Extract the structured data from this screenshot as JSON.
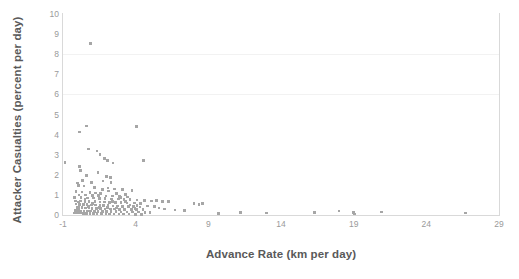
{
  "chart_data": {
    "type": "scatter",
    "title": "",
    "xlabel": "Advance Rate (km per day)",
    "ylabel": "Attacker Casualties (percent per day)",
    "xlim": [
      -1,
      29
    ],
    "ylim": [
      0,
      10
    ],
    "xticks": [
      "-1",
      "4",
      "9",
      "14",
      "19",
      "24",
      "29"
    ],
    "xtick_values": [
      -1,
      4,
      9,
      14,
      19,
      24,
      29
    ],
    "yticks": [
      "0",
      "1",
      "2",
      "3",
      "4",
      "5",
      "6",
      "7",
      "8",
      "9",
      "10"
    ],
    "ytick_values": [
      0,
      1,
      2,
      3,
      4,
      5,
      6,
      7,
      8,
      9,
      10
    ],
    "grid": "horizontal-faint",
    "gridline_values": [
      6,
      8
    ],
    "legend": "none",
    "marker_color": "#a6a6a6",
    "axis_color": "#d9d9d9",
    "tick_label_color": "#9a9a9a",
    "axis_title_color": "#595959",
    "points": [
      [
        0.9,
        8.52
      ],
      [
        0.6,
        4.42
      ],
      [
        4.05,
        4.4
      ],
      [
        0.15,
        4.12
      ],
      [
        0.75,
        3.28
      ],
      [
        1.35,
        3.18
      ],
      [
        1.55,
        3.02
      ],
      [
        1.85,
        2.82
      ],
      [
        2.05,
        2.7
      ],
      [
        2.45,
        2.58
      ],
      [
        4.55,
        2.72
      ],
      [
        -0.85,
        2.6
      ],
      [
        0.15,
        2.42
      ],
      [
        0.2,
        2.2
      ],
      [
        0.6,
        1.96
      ],
      [
        2.0,
        1.92
      ],
      [
        2.25,
        1.86
      ],
      [
        1.75,
        1.7
      ],
      [
        2.3,
        1.62
      ],
      [
        0.0,
        1.6
      ],
      [
        0.05,
        1.48
      ],
      [
        0.45,
        1.44
      ],
      [
        1.15,
        1.36
      ],
      [
        2.1,
        1.34
      ],
      [
        2.55,
        1.3
      ],
      [
        3.1,
        1.28
      ],
      [
        3.75,
        1.22
      ],
      [
        -0.1,
        1.16
      ],
      [
        0.3,
        1.14
      ],
      [
        0.85,
        1.12
      ],
      [
        1.25,
        1.1
      ],
      [
        1.6,
        1.08
      ],
      [
        2.7,
        1.06
      ],
      [
        3.3,
        1.02
      ],
      [
        0.1,
        1.0
      ],
      [
        0.55,
        0.99
      ],
      [
        1.05,
        0.97
      ],
      [
        1.45,
        0.96
      ],
      [
        1.95,
        0.95
      ],
      [
        2.4,
        0.94
      ],
      [
        2.9,
        0.92
      ],
      [
        3.45,
        0.9
      ],
      [
        -0.2,
        0.88
      ],
      [
        0.25,
        0.86
      ],
      [
        0.7,
        0.85
      ],
      [
        1.1,
        0.84
      ],
      [
        1.5,
        0.83
      ],
      [
        1.9,
        0.82
      ],
      [
        2.35,
        0.8
      ],
      [
        2.8,
        0.79
      ],
      [
        3.2,
        0.78
      ],
      [
        3.6,
        0.76
      ],
      [
        4.1,
        0.74
      ],
      [
        4.6,
        0.72
      ],
      [
        -0.15,
        0.7
      ],
      [
        0.2,
        0.69
      ],
      [
        0.5,
        0.68
      ],
      [
        0.8,
        0.67
      ],
      [
        1.2,
        0.66
      ],
      [
        1.55,
        0.65
      ],
      [
        1.85,
        0.64
      ],
      [
        2.2,
        0.63
      ],
      [
        2.6,
        0.62
      ],
      [
        3.0,
        0.61
      ],
      [
        3.4,
        0.6
      ],
      [
        3.9,
        0.59
      ],
      [
        4.35,
        0.58
      ],
      [
        5.1,
        0.7
      ],
      [
        5.45,
        0.72
      ],
      [
        5.85,
        0.68
      ],
      [
        6.25,
        0.66
      ],
      [
        8.0,
        0.58
      ],
      [
        8.35,
        0.52
      ],
      [
        8.6,
        0.56
      ],
      [
        -0.1,
        0.54
      ],
      [
        0.15,
        0.53
      ],
      [
        0.4,
        0.52
      ],
      [
        0.65,
        0.51
      ],
      [
        0.95,
        0.5
      ],
      [
        1.25,
        0.49
      ],
      [
        1.55,
        0.48
      ],
      [
        1.8,
        0.47
      ],
      [
        2.1,
        0.46
      ],
      [
        2.45,
        0.45
      ],
      [
        2.75,
        0.44
      ],
      [
        3.1,
        0.43
      ],
      [
        3.5,
        0.42
      ],
      [
        3.85,
        0.41
      ],
      [
        4.3,
        0.4
      ],
      [
        4.8,
        0.44
      ],
      [
        5.3,
        0.42
      ],
      [
        -0.05,
        0.38
      ],
      [
        0.1,
        0.37
      ],
      [
        0.3,
        0.36
      ],
      [
        0.55,
        0.35
      ],
      [
        0.8,
        0.34
      ],
      [
        1.0,
        0.33
      ],
      [
        1.3,
        0.32
      ],
      [
        1.6,
        0.31
      ],
      [
        1.9,
        0.3
      ],
      [
        2.25,
        0.3
      ],
      [
        2.55,
        0.29
      ],
      [
        2.9,
        0.28
      ],
      [
        3.25,
        0.28
      ],
      [
        3.7,
        0.27
      ],
      [
        4.05,
        0.26
      ],
      [
        4.5,
        0.26
      ],
      [
        6.7,
        0.24
      ],
      [
        7.35,
        0.22
      ],
      [
        -0.15,
        0.22
      ],
      [
        0.05,
        0.21
      ],
      [
        0.25,
        0.2
      ],
      [
        0.45,
        0.2
      ],
      [
        0.7,
        0.19
      ],
      [
        0.9,
        0.19
      ],
      [
        1.15,
        0.18
      ],
      [
        1.4,
        0.18
      ],
      [
        1.7,
        0.17
      ],
      [
        2.0,
        0.17
      ],
      [
        2.3,
        0.16
      ],
      [
        2.65,
        0.16
      ],
      [
        3.0,
        0.15
      ],
      [
        3.4,
        0.15
      ],
      [
        3.8,
        0.14
      ],
      [
        4.2,
        0.14
      ],
      [
        4.65,
        0.13
      ],
      [
        5.0,
        0.13
      ],
      [
        -0.2,
        0.1
      ],
      [
        0.0,
        0.09
      ],
      [
        0.2,
        0.09
      ],
      [
        0.4,
        0.08
      ],
      [
        0.6,
        0.08
      ],
      [
        0.85,
        0.07
      ],
      [
        1.1,
        0.07
      ],
      [
        1.35,
        0.06
      ],
      [
        1.65,
        0.06
      ],
      [
        1.95,
        0.05
      ],
      [
        2.2,
        0.05
      ],
      [
        2.5,
        0.05
      ],
      [
        2.85,
        0.04
      ],
      [
        3.15,
        0.04
      ],
      [
        3.55,
        0.04
      ],
      [
        4.0,
        0.03
      ],
      [
        4.4,
        0.03
      ],
      [
        11.2,
        0.12
      ],
      [
        13.0,
        0.1
      ],
      [
        16.3,
        0.12
      ],
      [
        18.0,
        0.2
      ],
      [
        19.0,
        0.12
      ],
      [
        19.05,
        0.04
      ],
      [
        20.9,
        0.14
      ],
      [
        26.7,
        0.1
      ],
      [
        9.7,
        0.08
      ],
      [
        0.35,
        1.72
      ],
      [
        1.4,
        2.1
      ],
      [
        2.15,
        1.2
      ],
      [
        5.6,
        0.34
      ],
      [
        6.0,
        0.3
      ],
      [
        0.95,
        1.62
      ],
      [
        1.7,
        1.26
      ],
      [
        2.95,
        0.86
      ],
      [
        3.3,
        0.66
      ],
      [
        0.5,
        0.76
      ],
      [
        1.05,
        0.58
      ],
      [
        2.4,
        0.68
      ],
      [
        3.6,
        0.5
      ],
      [
        4.1,
        0.48
      ],
      [
        0.05,
        0.64
      ],
      [
        0.75,
        0.43
      ],
      [
        1.5,
        0.38
      ],
      [
        2.05,
        0.36
      ],
      [
        2.7,
        0.34
      ],
      [
        3.95,
        0.32
      ]
    ]
  }
}
